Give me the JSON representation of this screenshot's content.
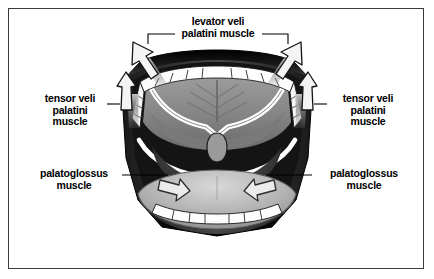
{
  "figure": {
    "border_color": "#3a3a3a",
    "background_color": "#ffffff",
    "ink_color": "#000000"
  },
  "labels": {
    "levator": "levator veli\npalatini muscle",
    "tensor_left": "tensor veli\npalatini\nmuscle",
    "tensor_right": "tensor veli\npalatini\nmuscle",
    "palatoglossus_left": "palatoglossus\nmuscle",
    "palatoglossus_right": "palatoglossus\nmuscle"
  },
  "anatomy": {
    "parts": [
      "upper-lip",
      "lower-lip",
      "upper-teeth",
      "lower-teeth",
      "hard-palate",
      "soft-palate",
      "palatine-arch",
      "uvula",
      "tongue",
      "oropharynx"
    ]
  },
  "arrows": {
    "levator_left": "up-outward",
    "levator_right": "up-outward",
    "tensor_left": "upward",
    "tensor_right": "upward",
    "palatoglossus_left": "down-inward",
    "palatoglossus_right": "down-inward"
  },
  "palette": {
    "lip_dark": "#0d0d0d",
    "teeth_white": "#fdfdfd",
    "palate_gray": "#8d8d8d",
    "tongue_gray": "#adadad",
    "pharynx_dark": "#2a2a2a",
    "arrow_fill": "#f2f2f2",
    "arrow_stroke": "#1a1a1a"
  }
}
